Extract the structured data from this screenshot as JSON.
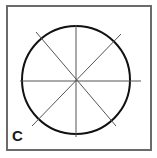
{
  "diagram": {
    "label": "C",
    "shape": "circle",
    "center": [
      76,
      80
    ],
    "radius": 54,
    "lines": [
      {
        "name": "horizontal",
        "x1": 20,
        "y1": 81,
        "x2": 141,
        "y2": 81
      },
      {
        "name": "vertical",
        "x1": 76,
        "y1": 25,
        "x2": 76,
        "y2": 137
      },
      {
        "name": "diagonal-1",
        "x1": 36,
        "y1": 32,
        "x2": 116,
        "y2": 126
      },
      {
        "name": "diagonal-2",
        "x1": 121,
        "y1": 34,
        "x2": 32,
        "y2": 126
      }
    ],
    "colors": {
      "circle": "#111111",
      "lines": "#555555",
      "border": "#6b6b6b"
    }
  }
}
